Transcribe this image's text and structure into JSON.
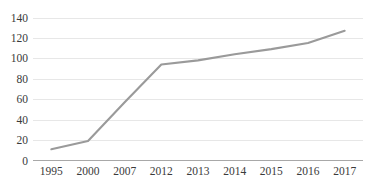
{
  "chart_data": {
    "type": "line",
    "title": "",
    "subtitle": "",
    "xlabel": "",
    "ylabel": "",
    "categories": [
      "1995",
      "2000",
      "2007",
      "2012",
      "2013",
      "2014",
      "2015",
      "2016",
      "2017"
    ],
    "values": [
      11,
      19,
      57,
      94,
      98,
      104,
      109,
      115,
      127
    ],
    "series": [
      {
        "name": "",
        "values": [
          11,
          19,
          57,
          94,
          98,
          104,
          109,
          115,
          127
        ],
        "color": "#9a9a9a"
      }
    ],
    "ylim": [
      0,
      140
    ],
    "yticks": [
      0,
      20,
      40,
      60,
      80,
      100,
      120,
      140
    ],
    "ytick_labels": [
      "0",
      "20",
      "40",
      "60",
      "80",
      "100",
      "120",
      "140"
    ],
    "xtick_labels": [
      "1995",
      "2000",
      "2007",
      "2012",
      "2013",
      "2014",
      "2015",
      "2016",
      "2017"
    ],
    "grid": true,
    "grid_axis": "y",
    "grid_color": "#e4e4e4",
    "legend": false,
    "legend_position": "none",
    "axis_color": "#a8a8a8",
    "background_color": "#ffffff",
    "tick_label_color": "#3a3a3a",
    "annotations": []
  }
}
